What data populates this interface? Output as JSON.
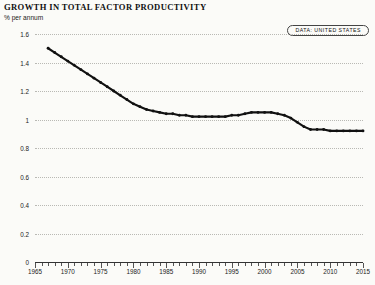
{
  "header": {
    "title": "GROWTH IN TOTAL FACTOR PRODUCTIVITY",
    "subtitle": "% per annum"
  },
  "legend": {
    "badge_label": "DATA: UNITED STATES"
  },
  "chart_data": {
    "type": "line",
    "title": "GROWTH IN TOTAL FACTOR PRODUCTIVITY",
    "subtitle": "% per annum",
    "xlabel": "",
    "ylabel": "% per annum",
    "xlim": [
      1965,
      2015
    ],
    "ylim": [
      0,
      1.6
    ],
    "grid": true,
    "legend_position": "top-right",
    "yticks": [
      0,
      0.2,
      0.4,
      0.6,
      0.8,
      1,
      1.2,
      1.4,
      1.6
    ],
    "ytick_labels": [
      "0",
      "0.2",
      "0.4",
      "0.6",
      "0.8",
      "1",
      "1.2",
      "1.4",
      "1.6"
    ],
    "xticks": [
      1965,
      1970,
      1975,
      1980,
      1985,
      1990,
      1995,
      2000,
      2005,
      2010,
      2015
    ],
    "xtick_labels": [
      "1965",
      "1970",
      "1975",
      "1980",
      "1985",
      "1990",
      "1995",
      "2000",
      "2005",
      "2010",
      "2015"
    ],
    "minor_tick_interval": 1,
    "line_color": "#111111",
    "grid_color": "#b9b9b4",
    "background_color": "#fbfbf8",
    "series": [
      {
        "name": "DATA: UNITED STATES",
        "x": [
          1967,
          1968,
          1969,
          1970,
          1971,
          1972,
          1973,
          1974,
          1975,
          1976,
          1977,
          1978,
          1979,
          1980,
          1981,
          1982,
          1983,
          1984,
          1985,
          1986,
          1987,
          1988,
          1989,
          1990,
          1991,
          1992,
          1993,
          1994,
          1995,
          1996,
          1997,
          1998,
          1999,
          2000,
          2001,
          2002,
          2003,
          2004,
          2005,
          2006,
          2007,
          2008,
          2009,
          2010,
          2011,
          2012,
          2013,
          2014,
          2015
        ],
        "values": [
          1.5,
          1.47,
          1.44,
          1.41,
          1.38,
          1.35,
          1.32,
          1.29,
          1.26,
          1.23,
          1.2,
          1.17,
          1.14,
          1.11,
          1.09,
          1.07,
          1.06,
          1.05,
          1.04,
          1.04,
          1.03,
          1.03,
          1.02,
          1.02,
          1.02,
          1.02,
          1.02,
          1.02,
          1.03,
          1.03,
          1.04,
          1.05,
          1.05,
          1.05,
          1.05,
          1.04,
          1.03,
          1.01,
          0.98,
          0.95,
          0.93,
          0.93,
          0.93,
          0.92,
          0.92,
          0.92,
          0.92,
          0.92,
          0.92
        ]
      }
    ]
  }
}
